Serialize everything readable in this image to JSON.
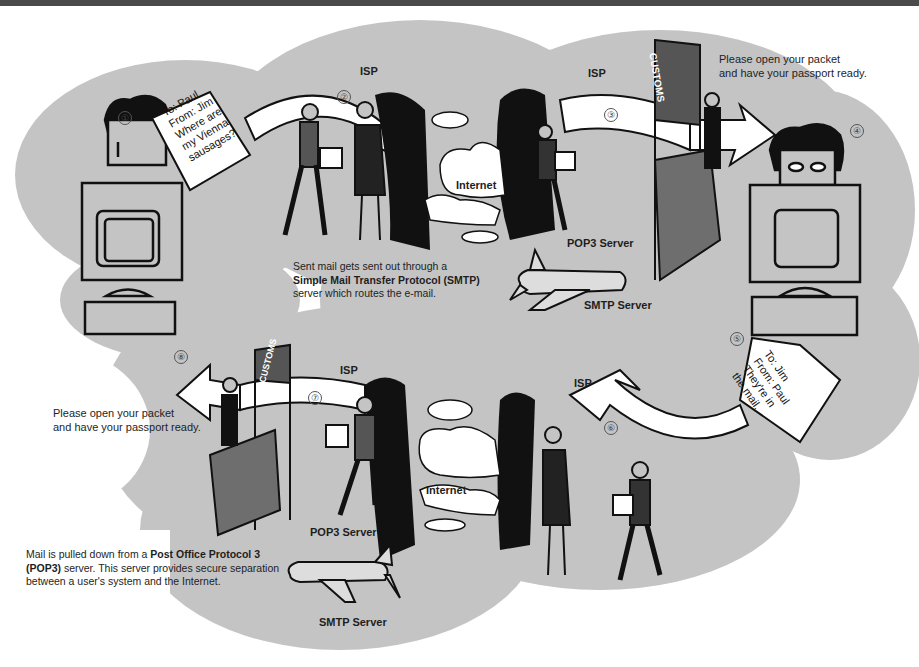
{
  "diagram": {
    "steps": [
      {
        "num": "①",
        "label": "step-1"
      },
      {
        "num": "②",
        "label": "step-2"
      },
      {
        "num": "③",
        "label": "step-3"
      },
      {
        "num": "④",
        "label": "step-4"
      },
      {
        "num": "⑤",
        "label": "step-5"
      },
      {
        "num": "⑥",
        "label": "step-6"
      },
      {
        "num": "⑦",
        "label": "step-7"
      },
      {
        "num": "⑧",
        "label": "step-8"
      }
    ],
    "messages": {
      "outgoing": {
        "to": "To: Paul",
        "from": "From: Jim",
        "line1": "Where are",
        "line2": "my Vienna",
        "line3": "sausages?"
      },
      "reply": {
        "to": "To: Jim",
        "from": "From: Paul",
        "line1": "They're in",
        "line2": "the mail."
      }
    },
    "labels": {
      "isp_top_left": "ISP",
      "isp_top_right": "ISP",
      "isp_bottom_left": "ISP",
      "isp_bottom_right": "ISP",
      "internet_top": "Internet",
      "internet_bottom": "Internet",
      "pop3_top": "POP3 Server",
      "smtp_top": "SMTP Server",
      "pop3_bottom": "POP3 Server",
      "smtp_bottom": "SMTP Server",
      "customs_top": "CUSTOMS",
      "customs_bottom": "CUSTOMS"
    },
    "speech": {
      "customs_top_line1": "Please open your packet",
      "customs_top_line2": "and have your passport ready.",
      "customs_bottom_line1": "Please open your packet",
      "customs_bottom_line2": "and have your passport ready."
    },
    "captions": {
      "smtp": {
        "pre": "Sent mail gets sent out through a",
        "bold": "Simple Mail Transfer Protocol  (SMTP)",
        "post": "server which routes the e-mail."
      },
      "pop3": {
        "pre": "Mail is pulled down from a ",
        "bold1": "Post Office Protocol 3",
        "bold2": "(POP3)",
        "post": " server. This server provides secure separation between a user's system and the Internet."
      }
    },
    "colors": {
      "cloud_gray": "#c4c4c4",
      "customs_booth": "#6e6e6e",
      "ink": "#111111",
      "paper": "#ffffff"
    }
  }
}
